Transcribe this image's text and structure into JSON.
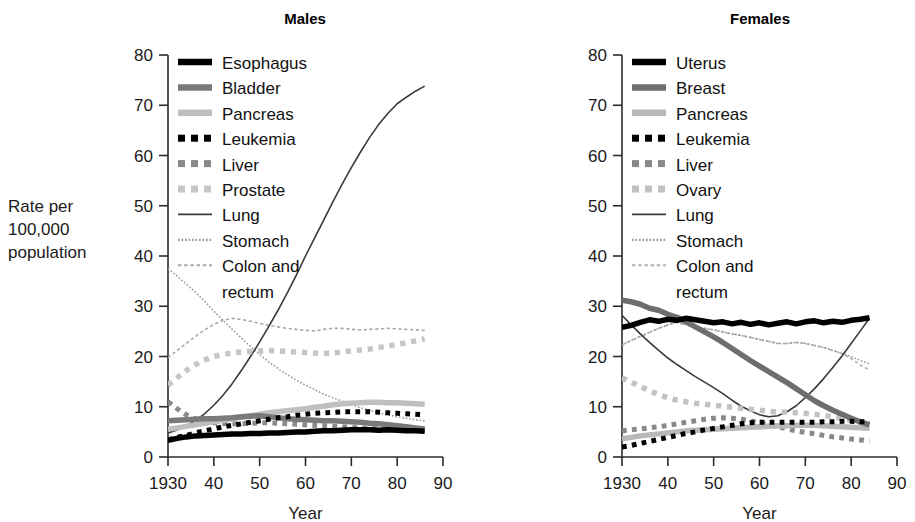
{
  "figure": {
    "background": "#ffffff",
    "ylabel_lines": [
      "Rate per",
      "100,000",
      "population"
    ],
    "xlabel": "Year"
  },
  "chart_data": [
    {
      "type": "line",
      "title": "Males",
      "xlabel": "Year",
      "ylabel": "Rate per 100,000 population",
      "xlim": [
        1930,
        1990
      ],
      "ylim": [
        0,
        80
      ],
      "xticks": [
        1930,
        1940,
        1950,
        1960,
        1970,
        1980,
        1990
      ],
      "xticklabels": [
        "1930",
        "40",
        "50",
        "60",
        "70",
        "80",
        "90"
      ],
      "yticks": [
        0,
        10,
        20,
        30,
        40,
        50,
        60,
        70,
        80
      ],
      "yticklabels": [
        "0",
        "10",
        "20",
        "30",
        "40",
        "50",
        "60",
        "70",
        "80"
      ],
      "grid": false,
      "legend_position": "upper-left-inside",
      "x": [
        1930,
        1932,
        1934,
        1936,
        1938,
        1940,
        1942,
        1944,
        1946,
        1948,
        1950,
        1952,
        1954,
        1956,
        1958,
        1960,
        1962,
        1964,
        1966,
        1968,
        1970,
        1972,
        1974,
        1976,
        1978,
        1980,
        1982,
        1984,
        1986
      ],
      "series": [
        {
          "name": "Esophagus",
          "style": "thick-solid",
          "color": "#000000",
          "width": 5.5,
          "values": [
            3.3,
            3.7,
            4.0,
            4.2,
            4.3,
            4.4,
            4.5,
            4.6,
            4.6,
            4.7,
            4.7,
            4.8,
            4.8,
            4.9,
            5.0,
            5.0,
            5.1,
            5.2,
            5.2,
            5.3,
            5.4,
            5.4,
            5.4,
            5.3,
            5.4,
            5.3,
            5.2,
            5.2,
            5.1
          ]
        },
        {
          "name": "Bladder",
          "style": "thick-solid",
          "color": "#7a7a7a",
          "width": 5.5,
          "values": [
            7.2,
            7.3,
            7.4,
            7.5,
            7.6,
            7.6,
            7.7,
            7.8,
            8.0,
            8.1,
            8.2,
            8.0,
            7.8,
            7.6,
            7.5,
            7.4,
            7.3,
            7.2,
            7.2,
            7.1,
            7.0,
            6.9,
            6.7,
            6.6,
            6.4,
            6.2,
            6.0,
            5.8,
            5.6
          ]
        },
        {
          "name": "Pancreas",
          "style": "thick-solid",
          "color": "#bfbfbf",
          "width": 5.5,
          "values": [
            5.5,
            5.8,
            6.1,
            6.4,
            6.7,
            7.0,
            7.3,
            7.6,
            7.9,
            8.2,
            8.5,
            8.8,
            9.0,
            9.2,
            9.4,
            9.6,
            9.9,
            10.1,
            10.4,
            10.6,
            10.7,
            10.8,
            10.9,
            10.9,
            10.8,
            10.8,
            10.7,
            10.6,
            10.5
          ]
        },
        {
          "name": "Leukemia",
          "style": "dotted-square",
          "color": "#000000",
          "width": 5.0,
          "values": [
            3.4,
            3.9,
            4.3,
            4.8,
            5.2,
            5.6,
            6.0,
            6.3,
            6.6,
            6.9,
            7.2,
            7.5,
            7.8,
            8.0,
            8.3,
            8.5,
            8.7,
            8.8,
            8.9,
            9.0,
            9.0,
            9.0,
            9.0,
            8.9,
            8.8,
            8.7,
            8.6,
            8.5,
            8.4
          ]
        },
        {
          "name": "Liver",
          "style": "dotted-square",
          "color": "#8a8a8a",
          "width": 5.0,
          "values": [
            11.0,
            9.6,
            8.4,
            7.6,
            7.1,
            6.8,
            6.6,
            6.6,
            6.6,
            6.7,
            6.8,
            6.8,
            6.7,
            6.6,
            6.5,
            6.4,
            6.3,
            6.2,
            6.1,
            6.0,
            5.9,
            5.8,
            5.7,
            5.6,
            5.5,
            5.4,
            5.3,
            5.3,
            5.2
          ]
        },
        {
          "name": "Prostate",
          "style": "dotted-square",
          "color": "#c6c6c6",
          "width": 5.5,
          "values": [
            14.3,
            15.8,
            17.2,
            18.4,
            19.3,
            20.0,
            20.4,
            20.7,
            20.9,
            21.0,
            21.1,
            21.2,
            21.1,
            21.0,
            20.9,
            20.8,
            20.7,
            20.6,
            20.7,
            20.9,
            21.1,
            21.3,
            21.5,
            21.8,
            22.1,
            22.4,
            22.7,
            23.1,
            23.5
          ]
        },
        {
          "name": "Lung",
          "style": "thin-solid",
          "color": "#3a3a3a",
          "width": 1.6,
          "values": [
            4.8,
            5.4,
            6.2,
            7.3,
            8.6,
            10.3,
            12.3,
            14.6,
            17.2,
            20.0,
            22.9,
            26.0,
            29.2,
            32.6,
            36.2,
            40.0,
            43.6,
            47.2,
            50.8,
            54.3,
            57.6,
            60.7,
            63.6,
            66.2,
            68.4,
            70.3,
            71.6,
            72.8,
            73.8
          ]
        },
        {
          "name": "Stomach",
          "style": "fine-dotted",
          "color": "#9a9a9a",
          "width": 1.6,
          "values": [
            37.5,
            36.0,
            34.4,
            32.8,
            31.0,
            29.0,
            27.2,
            25.4,
            23.7,
            22.0,
            20.4,
            18.9,
            17.6,
            16.4,
            15.3,
            14.3,
            13.4,
            12.5,
            11.8,
            11.1,
            10.4,
            9.8,
            9.3,
            8.8,
            8.4,
            8.0,
            7.7,
            7.4,
            7.2
          ]
        },
        {
          "name": "Colon and rectum",
          "style": "fine-dashed",
          "color": "#a8a8a8",
          "width": 1.6,
          "values": [
            19.8,
            21.2,
            22.6,
            24.0,
            25.3,
            26.4,
            27.2,
            27.6,
            27.4,
            27.0,
            26.6,
            26.2,
            25.9,
            25.6,
            25.4,
            25.2,
            25.1,
            25.4,
            25.6,
            25.6,
            25.4,
            25.3,
            25.4,
            25.5,
            25.6,
            25.5,
            25.4,
            25.3,
            25.2
          ]
        }
      ]
    },
    {
      "type": "line",
      "title": "Females",
      "xlabel": "Year",
      "ylabel": "Rate per 100,000 population",
      "xlim": [
        1930,
        1990
      ],
      "ylim": [
        0,
        80
      ],
      "xticks": [
        1930,
        1940,
        1950,
        1960,
        1970,
        1980,
        1990
      ],
      "xticklabels": [
        "1930",
        "40",
        "50",
        "60",
        "70",
        "80",
        "90"
      ],
      "yticks": [
        0,
        10,
        20,
        30,
        40,
        50,
        60,
        70,
        80
      ],
      "yticklabels": [
        "0",
        "10",
        "20",
        "30",
        "40",
        "50",
        "60",
        "70",
        "80"
      ],
      "grid": false,
      "legend_position": "upper-left-inside",
      "x": [
        1930,
        1932,
        1934,
        1936,
        1938,
        1940,
        1942,
        1944,
        1946,
        1948,
        1950,
        1952,
        1954,
        1956,
        1958,
        1960,
        1962,
        1964,
        1966,
        1968,
        1970,
        1972,
        1974,
        1976,
        1978,
        1980,
        1982,
        1984
      ],
      "series": [
        {
          "name": "Uterus",
          "style": "thick-solid",
          "color": "#000000",
          "width": 5.5,
          "values": [
            25.8,
            26.2,
            26.8,
            27.3,
            27.0,
            27.4,
            27.2,
            27.6,
            27.3,
            27.0,
            26.7,
            26.9,
            26.5,
            26.8,
            26.4,
            26.7,
            26.3,
            26.6,
            26.9,
            26.5,
            26.9,
            27.1,
            26.7,
            27.0,
            26.8,
            27.2,
            27.4,
            27.7
          ]
        },
        {
          "name": "Breast",
          "style": "thick-solid",
          "color": "#6e6e6e",
          "width": 5.5,
          "values": [
            31.2,
            30.9,
            30.4,
            29.6,
            29.2,
            28.4,
            27.8,
            26.9,
            25.9,
            24.9,
            23.9,
            22.8,
            21.6,
            20.4,
            19.2,
            18.1,
            17.0,
            15.9,
            14.8,
            13.6,
            12.4,
            11.2,
            10.2,
            9.3,
            8.5,
            7.7,
            7.0,
            6.4
          ]
        },
        {
          "name": "Pancreas",
          "style": "thick-solid",
          "color": "#b8b8b8",
          "width": 5.5,
          "values": [
            3.6,
            3.9,
            4.2,
            4.4,
            4.6,
            4.8,
            5.0,
            5.2,
            5.3,
            5.4,
            5.5,
            5.6,
            5.7,
            5.8,
            5.9,
            6.0,
            6.1,
            6.2,
            6.2,
            6.3,
            6.3,
            6.3,
            6.2,
            6.1,
            6.0,
            5.9,
            5.8,
            5.7
          ]
        },
        {
          "name": "Leukemia",
          "style": "dotted-square",
          "color": "#000000",
          "width": 5.0,
          "values": [
            2.0,
            2.3,
            2.7,
            3.1,
            3.5,
            3.9,
            4.3,
            4.7,
            5.0,
            5.4,
            5.7,
            6.0,
            6.3,
            6.6,
            6.8,
            6.9,
            6.9,
            6.9,
            6.9,
            6.9,
            6.9,
            6.9,
            7.0,
            7.0,
            7.1,
            7.1,
            7.0,
            7.0
          ]
        },
        {
          "name": "Liver",
          "style": "dotted-square",
          "color": "#888888",
          "width": 5.0,
          "values": [
            5.2,
            5.4,
            5.6,
            5.8,
            6.0,
            6.3,
            6.6,
            6.9,
            7.2,
            7.5,
            7.7,
            7.8,
            7.7,
            7.5,
            7.2,
            6.8,
            6.4,
            6.0,
            5.6,
            5.2,
            4.9,
            4.6,
            4.3,
            4.0,
            3.8,
            3.6,
            3.4,
            3.2
          ]
        },
        {
          "name": "Ovary",
          "style": "dotted-square",
          "color": "#c2c2c2",
          "width": 5.5,
          "values": [
            15.8,
            14.9,
            14.0,
            13.2,
            12.4,
            11.8,
            11.3,
            11.0,
            10.7,
            10.5,
            10.3,
            10.1,
            9.9,
            9.7,
            9.5,
            9.3,
            9.1,
            9.0,
            8.9,
            8.8,
            8.7,
            8.5,
            8.3,
            8.0,
            7.7,
            7.3,
            7.0,
            6.7
          ]
        },
        {
          "name": "Lung",
          "style": "thin-solid",
          "color": "#3a3a3a",
          "width": 1.6,
          "values": [
            28.2,
            26.3,
            24.5,
            22.8,
            21.2,
            19.7,
            18.4,
            17.2,
            16.0,
            14.9,
            13.8,
            12.6,
            11.3,
            10.1,
            9.2,
            8.4,
            8.0,
            8.2,
            9.0,
            10.2,
            11.8,
            13.6,
            15.6,
            17.8,
            20.1,
            22.6,
            25.1,
            27.6
          ]
        },
        {
          "name": "Stomach",
          "style": "fine-dotted",
          "color": "#9a9a9a",
          "width": 1.6,
          "values": [
            22.3,
            23.2,
            24.0,
            24.8,
            25.6,
            26.3,
            26.8,
            26.3,
            25.9,
            25.6,
            25.3,
            24.9,
            24.5,
            24.2,
            23.8,
            23.4,
            23.0,
            22.6,
            22.6,
            22.8,
            22.6,
            22.2,
            21.8,
            21.2,
            20.6,
            20.0,
            19.2,
            18.5
          ]
        },
        {
          "name": "Colon and rectum",
          "style": "fine-dashed",
          "color": "#b0b0b0",
          "width": 1.6,
          "values": [
            22.3,
            23.2,
            24.0,
            24.8,
            25.6,
            26.3,
            26.8,
            26.3,
            25.9,
            25.6,
            25.3,
            24.9,
            24.5,
            24.2,
            23.8,
            23.4,
            23.0,
            22.6,
            22.6,
            22.8,
            22.6,
            22.2,
            21.8,
            21.2,
            20.6,
            19.6,
            18.3,
            17.3
          ]
        }
      ]
    }
  ],
  "panels": [
    {
      "id": "males",
      "title": "Males",
      "legend": [
        {
          "label": "Esophagus",
          "swatch": "thick-solid",
          "color": "#000000"
        },
        {
          "label": "Bladder",
          "swatch": "thick-solid",
          "color": "#7a7a7a"
        },
        {
          "label": "Pancreas",
          "swatch": "thick-solid",
          "color": "#bfbfbf"
        },
        {
          "label": "Leukemia",
          "swatch": "dotted-square",
          "color": "#000000"
        },
        {
          "label": "Liver",
          "swatch": "dotted-square",
          "color": "#8a8a8a"
        },
        {
          "label": "Prostate",
          "swatch": "dotted-square",
          "color": "#c6c6c6"
        },
        {
          "label": "Lung",
          "swatch": "thin-solid",
          "color": "#3a3a3a"
        },
        {
          "label": "Stomach",
          "swatch": "fine-dotted",
          "color": "#9a9a9a"
        },
        {
          "label": "Colon and",
          "label2": "rectum",
          "swatch": "fine-dashed",
          "color": "#a8a8a8"
        }
      ]
    },
    {
      "id": "females",
      "title": "Females",
      "legend": [
        {
          "label": "Uterus",
          "swatch": "thick-solid",
          "color": "#000000"
        },
        {
          "label": "Breast",
          "swatch": "thick-solid",
          "color": "#6e6e6e"
        },
        {
          "label": "Pancreas",
          "swatch": "thick-solid",
          "color": "#b8b8b8"
        },
        {
          "label": "Leukemia",
          "swatch": "dotted-square",
          "color": "#000000"
        },
        {
          "label": "Liver",
          "swatch": "dotted-square",
          "color": "#888888"
        },
        {
          "label": "Ovary",
          "swatch": "dotted-square",
          "color": "#c2c2c2"
        },
        {
          "label": "Lung",
          "swatch": "thin-solid",
          "color": "#3a3a3a"
        },
        {
          "label": "Stomach",
          "swatch": "fine-dotted",
          "color": "#9a9a9a"
        },
        {
          "label": "Colon and",
          "label2": "rectum",
          "swatch": "fine-dashed",
          "color": "#b0b0b0"
        }
      ]
    }
  ]
}
